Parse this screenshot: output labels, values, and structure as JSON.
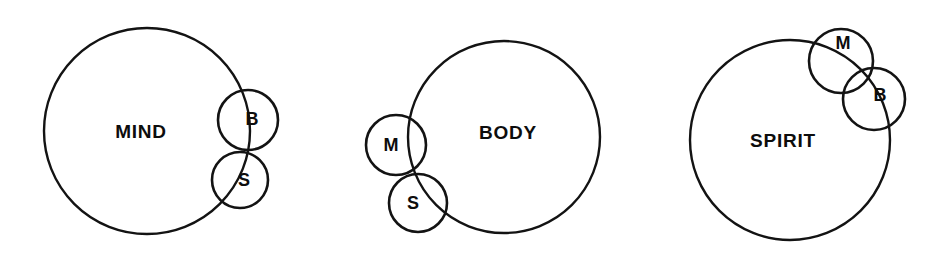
{
  "diagram": {
    "background_color": "#ffffff",
    "stroke_color": "#131313",
    "label_color": "#0d0d0d",
    "groups": [
      {
        "name": "mind-group",
        "major": {
          "label": "MIND",
          "cx": 147,
          "cy": 131,
          "r": 103,
          "label_x": 141,
          "label_y": 133
        },
        "minors": [
          {
            "key": "b",
            "label": "B",
            "cx": 248,
            "cy": 120,
            "r": 30,
            "label_x": 252,
            "label_y": 120
          },
          {
            "key": "s",
            "label": "S",
            "cx": 240,
            "cy": 180,
            "r": 28,
            "label_x": 244,
            "label_y": 181
          }
        ]
      },
      {
        "name": "body-group",
        "major": {
          "label": "BODY",
          "cx": 504,
          "cy": 137,
          "r": 96,
          "label_x": 508,
          "label_y": 134
        },
        "minors": [
          {
            "key": "m",
            "label": "M",
            "cx": 396,
            "cy": 145,
            "r": 30,
            "label_x": 391,
            "label_y": 146
          },
          {
            "key": "s",
            "label": "S",
            "cx": 418,
            "cy": 203,
            "r": 29,
            "label_x": 413,
            "label_y": 204
          }
        ]
      },
      {
        "name": "spirit-group",
        "major": {
          "label": "SPIRIT",
          "cx": 790,
          "cy": 140,
          "r": 100,
          "label_x": 783,
          "label_y": 142
        },
        "minors": [
          {
            "key": "m",
            "label": "M",
            "cx": 841,
            "cy": 61,
            "r": 32,
            "label_x": 843,
            "label_y": 44
          },
          {
            "key": "b",
            "label": "B",
            "cx": 874,
            "cy": 99,
            "r": 31,
            "label_x": 880,
            "label_y": 96
          }
        ]
      }
    ]
  }
}
